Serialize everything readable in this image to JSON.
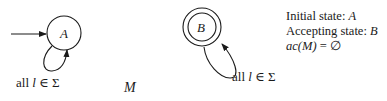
{
  "diagram": {
    "machine_name": "M",
    "states": [
      {
        "id": "A",
        "label": "A",
        "initial": true,
        "accepting": false
      },
      {
        "id": "B",
        "label": "B",
        "initial": false,
        "accepting": true
      }
    ],
    "transitions": [
      {
        "from": "A",
        "to": "A",
        "label_prefix": "all ",
        "symbol": "l",
        "label_suffix": " ∈ Σ"
      },
      {
        "from": "B",
        "to": "B",
        "label_prefix": "all ",
        "symbol": "l",
        "label_suffix": " ∈ Σ"
      }
    ],
    "info": {
      "initial_prefix": "Initial state: ",
      "initial_value": "A",
      "accepting_prefix": "Accepting state: ",
      "accepting_value": "B",
      "ac_func": "ac",
      "ac_arg": "(M)",
      "ac_rest": " = ∅"
    }
  }
}
